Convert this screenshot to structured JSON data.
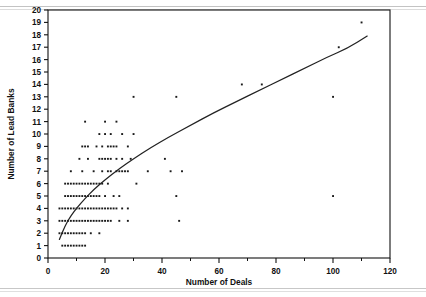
{
  "chart_data": {
    "type": "scatter",
    "title": "",
    "xlabel": "Number of Deals",
    "ylabel": "Number of Lead Banks",
    "xlim": [
      0,
      120
    ],
    "ylim": [
      0,
      20
    ],
    "xticks": [
      0,
      20,
      40,
      60,
      80,
      100,
      120
    ],
    "xminorticks": [
      10,
      30,
      50,
      70,
      90,
      110
    ],
    "yticks": [
      0,
      1,
      2,
      3,
      4,
      5,
      6,
      7,
      8,
      9,
      10,
      11,
      12,
      13,
      14,
      15,
      16,
      17,
      18,
      19,
      20
    ],
    "grid": false,
    "legend": null,
    "marker": "dot",
    "series": [
      {
        "name": "observations",
        "points": [
          [
            5,
            1
          ],
          [
            6,
            1
          ],
          [
            7,
            1
          ],
          [
            8,
            1
          ],
          [
            9,
            1
          ],
          [
            10,
            1
          ],
          [
            11,
            1
          ],
          [
            12,
            1
          ],
          [
            13,
            1
          ],
          [
            4,
            2
          ],
          [
            5,
            2
          ],
          [
            6,
            2
          ],
          [
            7,
            2
          ],
          [
            8,
            2
          ],
          [
            9,
            2
          ],
          [
            10,
            2
          ],
          [
            11,
            2
          ],
          [
            12,
            2
          ],
          [
            13,
            2
          ],
          [
            15,
            2
          ],
          [
            18,
            2
          ],
          [
            4,
            3
          ],
          [
            5,
            3
          ],
          [
            6,
            3
          ],
          [
            7,
            3
          ],
          [
            8,
            3
          ],
          [
            9,
            3
          ],
          [
            10,
            3
          ],
          [
            11,
            3
          ],
          [
            12,
            3
          ],
          [
            13,
            3
          ],
          [
            14,
            3
          ],
          [
            15,
            3
          ],
          [
            16,
            3
          ],
          [
            17,
            3
          ],
          [
            18,
            3
          ],
          [
            19,
            3
          ],
          [
            20,
            3
          ],
          [
            21,
            3
          ],
          [
            22,
            3
          ],
          [
            25,
            3
          ],
          [
            28,
            3
          ],
          [
            46,
            3
          ],
          [
            4,
            4
          ],
          [
            5,
            4
          ],
          [
            6,
            4
          ],
          [
            7,
            4
          ],
          [
            8,
            4
          ],
          [
            9,
            4
          ],
          [
            10,
            4
          ],
          [
            11,
            4
          ],
          [
            12,
            4
          ],
          [
            13,
            4
          ],
          [
            14,
            4
          ],
          [
            15,
            4
          ],
          [
            16,
            4
          ],
          [
            17,
            4
          ],
          [
            18,
            4
          ],
          [
            19,
            4
          ],
          [
            20,
            4
          ],
          [
            21,
            4
          ],
          [
            22,
            4
          ],
          [
            23,
            4
          ],
          [
            24,
            4
          ],
          [
            26,
            4
          ],
          [
            28,
            4
          ],
          [
            6,
            5
          ],
          [
            7,
            5
          ],
          [
            8,
            5
          ],
          [
            9,
            5
          ],
          [
            10,
            5
          ],
          [
            11,
            5
          ],
          [
            12,
            5
          ],
          [
            13,
            5
          ],
          [
            14,
            5
          ],
          [
            15,
            5
          ],
          [
            16,
            5
          ],
          [
            17,
            5
          ],
          [
            18,
            5
          ],
          [
            20,
            5
          ],
          [
            23,
            5
          ],
          [
            25,
            5
          ],
          [
            45,
            5
          ],
          [
            100,
            5
          ],
          [
            6,
            6
          ],
          [
            7,
            6
          ],
          [
            8,
            6
          ],
          [
            9,
            6
          ],
          [
            10,
            6
          ],
          [
            11,
            6
          ],
          [
            12,
            6
          ],
          [
            13,
            6
          ],
          [
            14,
            6
          ],
          [
            15,
            6
          ],
          [
            16,
            6
          ],
          [
            17,
            6
          ],
          [
            18,
            6
          ],
          [
            19,
            6
          ],
          [
            21,
            6
          ],
          [
            31,
            6
          ],
          [
            8,
            7
          ],
          [
            12,
            7
          ],
          [
            16,
            7
          ],
          [
            19,
            7
          ],
          [
            21,
            7
          ],
          [
            22,
            7
          ],
          [
            24,
            7
          ],
          [
            25,
            7
          ],
          [
            26,
            7
          ],
          [
            27,
            7
          ],
          [
            28,
            7
          ],
          [
            35,
            7
          ],
          [
            43,
            7
          ],
          [
            47,
            7
          ],
          [
            11,
            8
          ],
          [
            14,
            8
          ],
          [
            18,
            8
          ],
          [
            19,
            8
          ],
          [
            20,
            8
          ],
          [
            21,
            8
          ],
          [
            22,
            8
          ],
          [
            24,
            8
          ],
          [
            26,
            8
          ],
          [
            29,
            8
          ],
          [
            41,
            8
          ],
          [
            12,
            9
          ],
          [
            13,
            9
          ],
          [
            14,
            9
          ],
          [
            17,
            9
          ],
          [
            19,
            9
          ],
          [
            21,
            9
          ],
          [
            22,
            9
          ],
          [
            23,
            9
          ],
          [
            24,
            9
          ],
          [
            28,
            9
          ],
          [
            18,
            10
          ],
          [
            20,
            10
          ],
          [
            22,
            10
          ],
          [
            26,
            10
          ],
          [
            30,
            10
          ],
          [
            13,
            11
          ],
          [
            20,
            11
          ],
          [
            24,
            11
          ],
          [
            30,
            13
          ],
          [
            45,
            13
          ],
          [
            100,
            13
          ],
          [
            68,
            14
          ],
          [
            75,
            14
          ],
          [
            102,
            17
          ],
          [
            110,
            19
          ]
        ]
      }
    ],
    "fit_curve": {
      "name": "fitted logarithmic trend",
      "points": [
        [
          4,
          1.5
        ],
        [
          6,
          2.6
        ],
        [
          8,
          3.4
        ],
        [
          10,
          4.0
        ],
        [
          13,
          4.8
        ],
        [
          16,
          5.5
        ],
        [
          20,
          6.3
        ],
        [
          25,
          7.2
        ],
        [
          30,
          8.0
        ],
        [
          36,
          8.9
        ],
        [
          42,
          9.7
        ],
        [
          50,
          10.7
        ],
        [
          58,
          11.7
        ],
        [
          66,
          12.6
        ],
        [
          74,
          13.5
        ],
        [
          82,
          14.4
        ],
        [
          90,
          15.3
        ],
        [
          98,
          16.2
        ],
        [
          105,
          16.9
        ],
        [
          112,
          17.9
        ]
      ]
    }
  },
  "axes": {
    "x_title": "Number of Deals",
    "y_title": "Number of Lead Banks",
    "x_tick_labels": [
      "0",
      "20",
      "40",
      "60",
      "80",
      "100",
      "120"
    ],
    "y_tick_labels": [
      "0",
      "1",
      "2",
      "3",
      "4",
      "5",
      "6",
      "7",
      "8",
      "9",
      "10",
      "11",
      "12",
      "13",
      "14",
      "15",
      "16",
      "17",
      "18",
      "19",
      "20"
    ]
  },
  "style": {
    "axis_color": "#111111",
    "point_color": "#1a1a1a",
    "curve_color": "#222222",
    "background": "#ffffff"
  }
}
